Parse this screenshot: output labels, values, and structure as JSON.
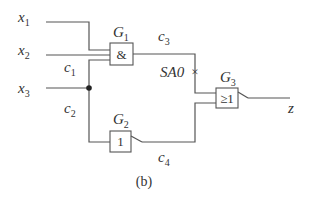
{
  "inputs": [
    {
      "name": "x",
      "sub": "1"
    },
    {
      "name": "x",
      "sub": "2"
    },
    {
      "name": "x",
      "sub": "3"
    }
  ],
  "gates": [
    {
      "name": "G",
      "sub": "1",
      "symbol": "&"
    },
    {
      "name": "G",
      "sub": "2",
      "symbol": "1"
    },
    {
      "name": "G",
      "sub": "3",
      "symbol": "≥1"
    }
  ],
  "wires": [
    {
      "name": "c",
      "sub": "1"
    },
    {
      "name": "c",
      "sub": "2"
    },
    {
      "name": "c",
      "sub": "3"
    },
    {
      "name": "c",
      "sub": "4"
    }
  ],
  "fault": {
    "label": "SA0",
    "marker": "×"
  },
  "output": {
    "name": "z"
  },
  "caption": "(b)"
}
